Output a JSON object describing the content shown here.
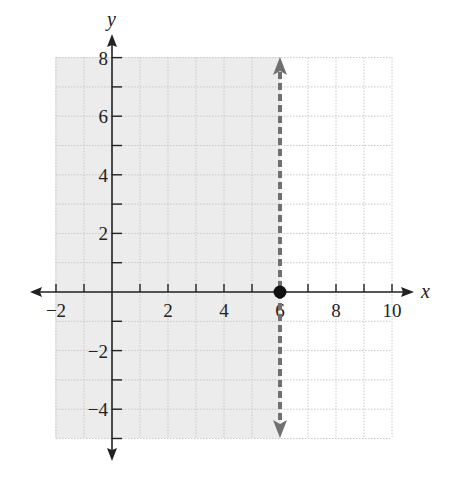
{
  "chart_data": {
    "type": "line",
    "title": "",
    "xlabel": "x",
    "ylabel": "y",
    "xlim": [
      -2,
      10
    ],
    "ylim": [
      -5,
      8
    ],
    "grid": true,
    "x_tick_labels": [
      "-2",
      "2",
      "4",
      "6",
      "8",
      "10"
    ],
    "x_ticks": [
      -2,
      -1,
      1,
      2,
      3,
      4,
      5,
      6,
      7,
      8,
      9,
      10
    ],
    "y_tick_labels": [
      "8",
      "6",
      "4",
      "2",
      "-2",
      "-4"
    ],
    "y_ticks": [
      8,
      7,
      6,
      5,
      4,
      3,
      2,
      1,
      -1,
      -2,
      -3,
      -4,
      -5
    ],
    "boundary_line": {
      "equation": "x = 6",
      "style": "dashed",
      "color": "#6e6e6e",
      "arrows": "both"
    },
    "point": {
      "x": 6,
      "y": 0,
      "filled": true,
      "color": "#111111"
    },
    "shaded_region": {
      "inequality": "x < 6",
      "x_range": [
        -2,
        6
      ],
      "y_range": [
        -5,
        8
      ],
      "color": "#eeeeee"
    },
    "legend": null
  },
  "labels": {
    "x_axis": "x",
    "y_axis": "y",
    "x_ticks": [
      "−2",
      "2",
      "4",
      "6",
      "8",
      "10"
    ],
    "y_ticks": [
      "8",
      "6",
      "4",
      "2",
      "−2",
      "−4"
    ]
  },
  "colors": {
    "shade": "#ececec",
    "grid": "#c8c8c8",
    "axis": "#222222",
    "boundary": "#707070",
    "point": "#111111"
  }
}
